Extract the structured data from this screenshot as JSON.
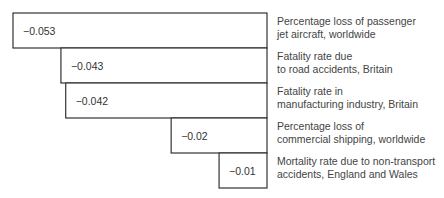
{
  "chart_data": {
    "type": "bar",
    "orientation": "horizontal",
    "title": "",
    "xlabel": "",
    "ylabel": "",
    "xlim": [
      -0.053,
      0
    ],
    "grid": false,
    "legend": "none",
    "categories": [
      [
        "Percentage loss of passenger",
        "jet aircraft, worldwide"
      ],
      [
        "Fatality rate due",
        "to road accidents, Britain"
      ],
      [
        "Fatality rate in",
        "manufacturing industry, Britain"
      ],
      [
        "Percentage loss of",
        "commercial shipping, worldwide"
      ],
      [
        "Mortality rate due to non-transport",
        "accidents, England and Wales"
      ]
    ],
    "values": [
      -0.053,
      -0.043,
      -0.042,
      -0.02,
      -0.01
    ],
    "value_labels": [
      "−0.053",
      "−0.043",
      "−0.042",
      "−0.02",
      "−0.01"
    ],
    "colors": {
      "bar_fill": "#ffffff",
      "bar_stroke": "#333333"
    }
  }
}
